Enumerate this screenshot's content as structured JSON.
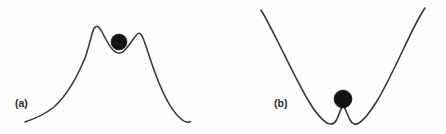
{
  "figure": {
    "background_color": "#fefefe",
    "curve_color": "#3a3a3a",
    "ball_color": "#141414",
    "width": 446,
    "height": 134
  },
  "panels": [
    {
      "id": "a",
      "label": "(a)",
      "description": "ball resting in shallow local minimum between two hill peaks",
      "ball": {
        "cx": 119,
        "cy": 42,
        "r": 8
      },
      "curve_path": "M 25 122 C 34 119 44 115 54 107 C 65 97 76 80 85 58 C 89 47 91 36 93.5 29.5 C 96 24 99 26 102 32 C 106 40 110 47 113.5 50.5 C 117 54 121 54 124.5 50.5 C 128.5 46.5 133 39 136.5 35 C 139 32 141 33 143 38 C 147 48 151 63 157 78 C 164 96 172 111 180 118 C 184.5 122 188 123 190 121.5"
    },
    {
      "id": "b",
      "label": "(b)",
      "description": "ball balanced on sharp local maximum between two potential wells",
      "ball": {
        "cx": 343,
        "cy": 99,
        "r": 9
      },
      "curve_path": "M 261 10 C 266 18 272 30 279 44 C 288 62 298 83 308 100 C 315 112 322 120 327 123 C 331 125 334 124.5 336.5 120 C 339 115 341 108 343 104.5 C 345 108 347.5 115 350 120 C 352.5 124.5 355.5 125 359 123 C 364 120 370 112 377 101 C 385 88 394 69 403 50 C 411 33 418 19 423 11 C 424 9.5 424.5 8.5 425 8"
    }
  ],
  "chart_data": {
    "type": "line",
    "title": "",
    "xlabel": "",
    "ylabel": "",
    "grid": false,
    "legend": "none",
    "series": [
      {
        "name": "(a) double-hump potential with ball in shallow central dip",
        "points": [
          [
            25,
            122
          ],
          [
            40,
            117
          ],
          [
            54,
            107
          ],
          [
            68,
            93
          ],
          [
            80,
            71
          ],
          [
            93.5,
            29.5
          ],
          [
            103,
            34
          ],
          [
            113,
            50
          ],
          [
            119,
            52
          ],
          [
            125,
            50
          ],
          [
            136.5,
            35
          ],
          [
            143,
            38
          ],
          [
            152,
            65
          ],
          [
            165,
            98
          ],
          [
            178,
            116
          ],
          [
            190,
            121.5
          ]
        ],
        "marker": {
          "label": "ball",
          "x": 119,
          "y": 42,
          "radius": 8
        }
      },
      {
        "name": "(b) double-well potential with ball on central barrier peak",
        "points": [
          [
            261,
            10
          ],
          [
            275,
            36
          ],
          [
            290,
            63
          ],
          [
            305,
            94
          ],
          [
            320,
            116
          ],
          [
            331,
            124
          ],
          [
            336,
            120
          ],
          [
            343,
            104.5
          ],
          [
            350,
            120
          ],
          [
            356,
            124
          ],
          [
            367,
            114
          ],
          [
            382,
            92
          ],
          [
            398,
            61
          ],
          [
            412,
            32
          ],
          [
            425,
            8
          ]
        ],
        "marker": {
          "label": "ball",
          "x": 343,
          "y": 99,
          "radius": 9
        }
      }
    ]
  }
}
